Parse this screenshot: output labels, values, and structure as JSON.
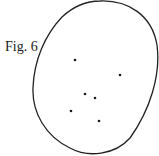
{
  "figure": {
    "label": "Fig. 6",
    "outline": {
      "shape": "irregular-ellipse",
      "stroke": "#222222"
    },
    "points": [
      {
        "x": 75,
        "y": 60
      },
      {
        "x": 120,
        "y": 75
      },
      {
        "x": 85,
        "y": 94
      },
      {
        "x": 95,
        "y": 98
      },
      {
        "x": 71,
        "y": 111
      },
      {
        "x": 99,
        "y": 121
      }
    ],
    "point_color": "#1a1a1a"
  }
}
